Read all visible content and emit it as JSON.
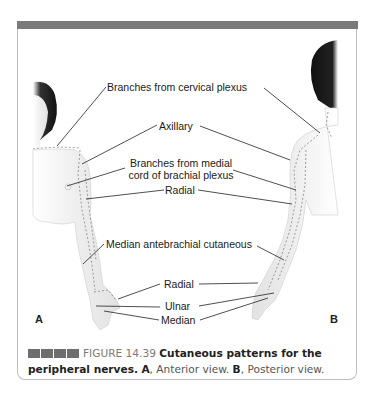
{
  "figure": {
    "labels": {
      "cervical": "Branches from cervical plexus",
      "axillary": "Axillary",
      "medial_line1": "Branches from medial",
      "medial_line2": "cord of brachial plexus",
      "radial_upper": "Radial",
      "median_antebrachial": "Median antebrachial cutaneous",
      "radial_lower": "Radial",
      "ulnar": "Ulnar",
      "median": "Median"
    },
    "panel_a": "A",
    "panel_b": "B"
  },
  "caption": {
    "number": "FIGURE 14.39",
    "title": "Cutaneous patterns for the peripheral nerves.",
    "a_letter": "A",
    "a_text": ", Anterior view. ",
    "b_letter": "B",
    "b_text": ", Posterior view."
  },
  "colors": {
    "topbar": "#7a7a7a",
    "frame_border": "#bdbdbd",
    "caption_blocks": "#6e6e6e"
  }
}
